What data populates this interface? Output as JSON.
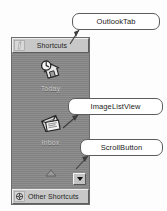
{
  "figure": {
    "caption": "",
    "type": "annotated-ui-diagram",
    "colors": {
      "panel_background": "#898989",
      "tab_face": "#c8c8c8",
      "border": "#6d6d6d",
      "callout_background": "#ffffff",
      "callout_border": "#5c5c5c",
      "caption_text": "#c9c9c9"
    }
  },
  "outlook_bar": {
    "top_tab": {
      "label": "Shortcuts",
      "icon": "shortcut-arrow-icon"
    },
    "bottom_tab": {
      "label": "Other Shortcuts",
      "icon": "folder-globe-icon"
    },
    "image_list_view": {
      "items": [
        {
          "label": "Today",
          "icon": "outlook-today-house-clock-icon"
        },
        {
          "label": "Inbox",
          "icon": "inbox-envelope-icon"
        },
        {
          "label": "",
          "icon": "partial-item-icon"
        }
      ]
    },
    "scroll_button": {
      "label": "",
      "icon": "chevron-down-icon",
      "direction": "down"
    }
  },
  "callouts": [
    {
      "id": "outlooktab",
      "label": "OutlookTab",
      "points_to": "top-tab"
    },
    {
      "id": "imagelistview",
      "label": "ImageListView",
      "points_to": "icon-list-area"
    },
    {
      "id": "scrollbutton",
      "label": "ScrollButton",
      "points_to": "scroll-button"
    }
  ]
}
